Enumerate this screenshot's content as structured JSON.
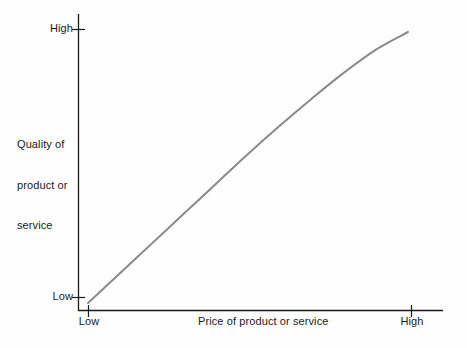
{
  "chart_data": {
    "type": "line",
    "title": "",
    "subtitle": "",
    "xlabel": "Price of product or service",
    "ylabel": "Quality of product or service",
    "ylabel_lines": [
      "Quality of",
      "product or",
      "service"
    ],
    "x_tick_labels": [
      "Low",
      "High"
    ],
    "y_tick_labels": [
      "Low",
      "High"
    ],
    "xlim": [
      "Low",
      "High"
    ],
    "ylim": [
      "Low",
      "High"
    ],
    "grid": false,
    "legend": null,
    "annotations": [],
    "series": [
      {
        "name": "Quality vs Price",
        "color": "#8a8a8a",
        "line_width": 2,
        "description": "Monotonically increasing, slightly concave-down curve rising from low price / low quality to high price / high quality",
        "points": [
          {
            "x": 0.0,
            "y": 0.0
          },
          {
            "x": 0.1,
            "y": 0.11
          },
          {
            "x": 0.2,
            "y": 0.22
          },
          {
            "x": 0.3,
            "y": 0.33
          },
          {
            "x": 0.4,
            "y": 0.44
          },
          {
            "x": 0.5,
            "y": 0.55
          },
          {
            "x": 0.6,
            "y": 0.655
          },
          {
            "x": 0.7,
            "y": 0.755
          },
          {
            "x": 0.8,
            "y": 0.85
          },
          {
            "x": 0.9,
            "y": 0.935
          },
          {
            "x": 1.0,
            "y": 1.0
          }
        ]
      }
    ]
  },
  "axes": {
    "y_tick_high": "High",
    "y_tick_low": "Low",
    "x_tick_low": "Low",
    "x_tick_high": "High",
    "y_title_line1": "Quality of",
    "y_title_line2": "product or",
    "y_title_line3": "service",
    "x_title": "Price of product or service"
  },
  "colors": {
    "background": "#fefefe",
    "axis": "#1a1a1a",
    "curve": "#8a8a8a",
    "text": "#1a1a1a"
  }
}
